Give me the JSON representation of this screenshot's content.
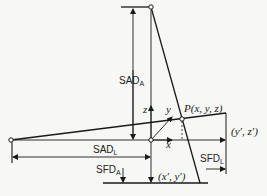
{
  "figure": {
    "type": "geometry-diagram"
  },
  "labels": {
    "sad_a": "SAD",
    "sad_a_sub": "A",
    "sad_l": "SAD",
    "sad_l_sub": "L",
    "sfd_a": "SFD",
    "sfd_a_sub": "A",
    "sfd_l": "SFD",
    "sfd_l_sub": "L",
    "point_p": "P(x, y, z)",
    "proj_lateral": "(y′, z′)",
    "proj_ap": "(x′, y′)",
    "axis_x": "x",
    "axis_y": "y",
    "axis_z": "z"
  },
  "colors": {
    "line": "#1a1a1a",
    "background": "#f7f7f5"
  }
}
